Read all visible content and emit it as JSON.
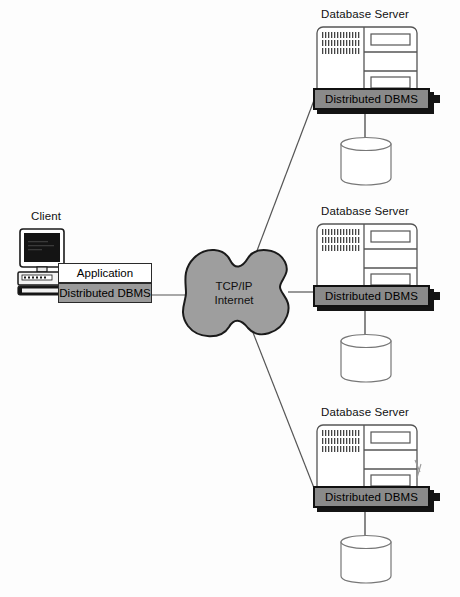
{
  "diagram": {
    "title_present": false,
    "colors": {
      "cloud_fill": "#9e9e9e",
      "cloud_stroke": "#1a1a1a",
      "dbms_bar_fill": "#8a8a8a",
      "dbms_bar_stroke": "#111111",
      "client_dbms_fill": "#9a9a9a",
      "app_fill": "#ffffff",
      "server_stroke": "#555555",
      "cylinder_stroke": "#777777",
      "line_stroke": "#555555",
      "background": "#fdfdfd"
    }
  },
  "client": {
    "label": "Client",
    "application_label": "Application",
    "dbms_label": "Distributed DBMS",
    "icon": "desktop-computer-icon"
  },
  "cloud": {
    "line1": "TCP/IP",
    "line2": "Internet",
    "icon": "network-cloud-icon"
  },
  "servers": [
    {
      "title": "Database Server",
      "dbms_label": "Distributed DBMS",
      "server_icon": "rack-server-icon",
      "database_icon": "database-cylinder-icon"
    },
    {
      "title": "Database Server",
      "dbms_label": "Distributed DBMS",
      "server_icon": "rack-server-icon",
      "database_icon": "database-cylinder-icon"
    },
    {
      "title": "Database Server",
      "dbms_label": "Distributed DBMS",
      "server_icon": "rack-server-icon",
      "database_icon": "database-cylinder-icon"
    }
  ],
  "connections": [
    {
      "from": "cloud",
      "to": "server-1",
      "style": "diagonal-up-right"
    },
    {
      "from": "cloud",
      "to": "server-2",
      "style": "horizontal"
    },
    {
      "from": "cloud",
      "to": "server-3",
      "style": "diagonal-down-right"
    },
    {
      "from": "client",
      "to": "cloud",
      "style": "horizontal"
    }
  ]
}
